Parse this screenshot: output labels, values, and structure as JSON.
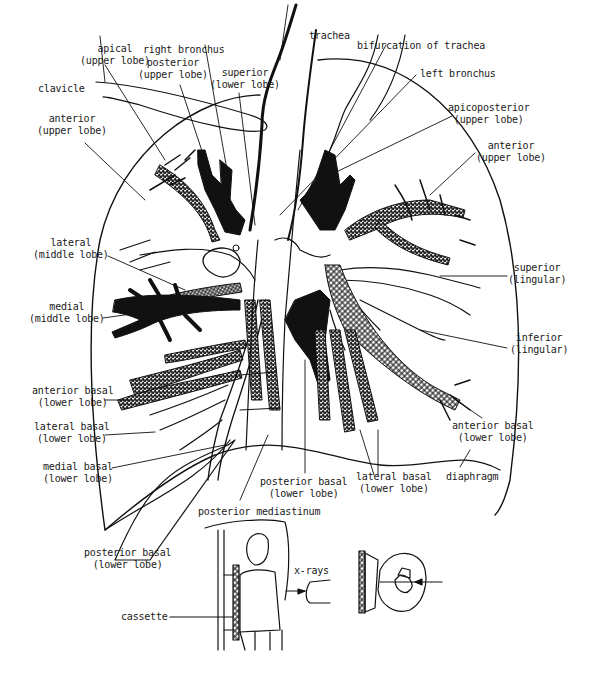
{
  "figure": {
    "labels": {
      "trachea": "trachea",
      "bifurcation": "bifurcation of trachea",
      "left_bronchus": "left bronchus",
      "right_bronchus": "right bronchus",
      "apical": [
        "apical",
        "(upper lobe)"
      ],
      "posterior_upper": [
        "posterior",
        "(upper lobe)"
      ],
      "superior_lower": [
        "superior",
        "(lower lobe)"
      ],
      "clavicle": "clavicle",
      "anterior_upper_right": [
        "anterior",
        "(upper lobe)"
      ],
      "apicoposterior": [
        "apicoposterior",
        "(upper lobe)"
      ],
      "anterior_upper_left": [
        "anterior",
        "(upper lobe)"
      ],
      "lateral_middle": [
        "lateral",
        "(middle lobe)"
      ],
      "medial_middle": [
        "medial",
        "(middle lobe)"
      ],
      "superior_lingular": [
        "superior",
        "(lingular)"
      ],
      "inferior_lingular": [
        "inferior",
        "(lingular)"
      ],
      "anterior_basal_right": [
        "anterior basal",
        "(lower lobe)"
      ],
      "lateral_basal_right": [
        "lateral basal",
        "(lower lobe)"
      ],
      "medial_basal": [
        "medial basal",
        "(lower lobe)"
      ],
      "anterior_basal_left": [
        "anterior basal",
        "(lower lobe)"
      ],
      "posterior_basal_center": [
        "posterior basal",
        "(lower lobe)"
      ],
      "lateral_basal_center": [
        "lateral basal",
        "(lower lobe)"
      ],
      "diaphragm": "diaphragm",
      "posterior_mediastinum": "posterior mediastinum",
      "posterior_basal_left": [
        "posterior basal",
        "(lower lobe)"
      ],
      "xrays": "x-rays",
      "cassette": "cassette"
    }
  }
}
